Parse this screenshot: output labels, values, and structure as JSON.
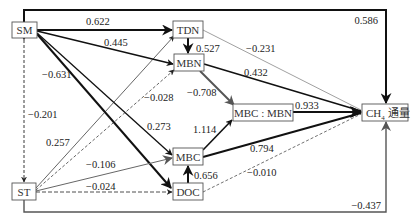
{
  "nodes": {
    "SM": {
      "label": "SM",
      "x": 12,
      "y": 22,
      "w": 25,
      "h": 16
    },
    "ST": {
      "label": "ST",
      "x": 12,
      "y": 183,
      "w": 24,
      "h": 17
    },
    "TDN": {
      "label": "TDN",
      "x": 173,
      "y": 21,
      "w": 30,
      "h": 17
    },
    "MBN": {
      "label": "MBN",
      "x": 174,
      "y": 54,
      "w": 30,
      "h": 17
    },
    "MBC": {
      "label": "MBC",
      "x": 173,
      "y": 148,
      "w": 30,
      "h": 17
    },
    "DOC": {
      "label": "DOC",
      "x": 173,
      "y": 183,
      "w": 30,
      "h": 17
    },
    "RATIO": {
      "label": "MBC : MBN",
      "x": 233,
      "y": 104,
      "w": 60,
      "h": 17
    },
    "CH4": {
      "label": "CH",
      "sub": "4",
      "suffix": " 通量",
      "x": 362,
      "y": 104,
      "w": 46,
      "h": 17
    }
  },
  "paths": [
    {
      "from": "SM",
      "to": "TDN",
      "coef": "0.622",
      "style": "solid",
      "weight": "thick"
    },
    {
      "from": "SM",
      "to": "MBN",
      "coef": "0.445",
      "style": "solid",
      "weight": "medium"
    },
    {
      "from": "SM",
      "to": "DOC",
      "coef": "-0.631",
      "style": "solid",
      "weight": "thick"
    },
    {
      "from": "SM",
      "to": "MBC",
      "coef": "0.273",
      "style": "solid",
      "weight": "medium"
    },
    {
      "from": "SM",
      "to": "CH4",
      "coef": "0.586",
      "style": "solid",
      "weight": "thick"
    },
    {
      "from": "ST",
      "to": "SM",
      "coef": "-0.201",
      "style": "dashed",
      "weight": "thin"
    },
    {
      "from": "ST",
      "to": "TDN",
      "coef": "0.257",
      "style": "solid",
      "weight": "thin"
    },
    {
      "from": "ST",
      "to": "MBN",
      "coef": "-0.028",
      "style": "dashed",
      "weight": "thin"
    },
    {
      "from": "ST",
      "to": "MBC",
      "coef": "-0.106",
      "style": "solid",
      "weight": "thin",
      "color": "gray"
    },
    {
      "from": "ST",
      "to": "DOC",
      "coef": "-0.024",
      "style": "dashed",
      "weight": "thin"
    },
    {
      "from": "ST",
      "to": "CH4",
      "coef": "-0.437",
      "style": "solid",
      "weight": "medium",
      "color": "gray"
    },
    {
      "from": "TDN",
      "to": "MBN",
      "coef": "0.527",
      "style": "solid",
      "weight": "thick"
    },
    {
      "from": "TDN",
      "to": "CH4",
      "coef": "-0.231",
      "style": "solid",
      "weight": "thin",
      "color": "gray"
    },
    {
      "from": "MBN",
      "to": "CH4",
      "coef": "0.432",
      "style": "solid",
      "weight": "medium"
    },
    {
      "from": "MBN",
      "to": "RATIO",
      "coef": "-0.708",
      "style": "solid",
      "weight": "thick",
      "color": "gray"
    },
    {
      "from": "MBC",
      "to": "RATIO",
      "coef": "1.114",
      "style": "solid",
      "weight": "thick"
    },
    {
      "from": "MBC",
      "to": "CH4",
      "coef": "0.794",
      "style": "solid",
      "weight": "thick"
    },
    {
      "from": "DOC",
      "to": "MBC",
      "coef": "0.656",
      "style": "solid",
      "weight": "thick"
    },
    {
      "from": "DOC",
      "to": "CH4",
      "coef": "-0.010",
      "style": "dashed",
      "weight": "thin"
    },
    {
      "from": "RATIO",
      "to": "CH4",
      "coef": "0.933",
      "style": "solid",
      "weight": "thick"
    }
  ],
  "labels": {
    "sm_tdn": "0.622",
    "sm_mbn": "0.445",
    "sm_doc": "−0.631",
    "sm_mbc": "0.273",
    "sm_ch4": "0.586",
    "st_sm": "−0.201",
    "st_tdn": "0.257",
    "st_mbn": "−0.028",
    "st_mbc": "−0.106",
    "st_doc": "−0.024",
    "st_ch4": "−0.437",
    "tdn_mbn": "0.527",
    "tdn_ch4": "−0.231",
    "mbn_ch4": "0.432",
    "mbn_ratio": "−0.708",
    "mbc_ratio": "1.114",
    "mbc_ch4": "0.794",
    "doc_mbc": "0.656",
    "doc_ch4": "−0.010",
    "ratio_ch4": "0.933"
  }
}
